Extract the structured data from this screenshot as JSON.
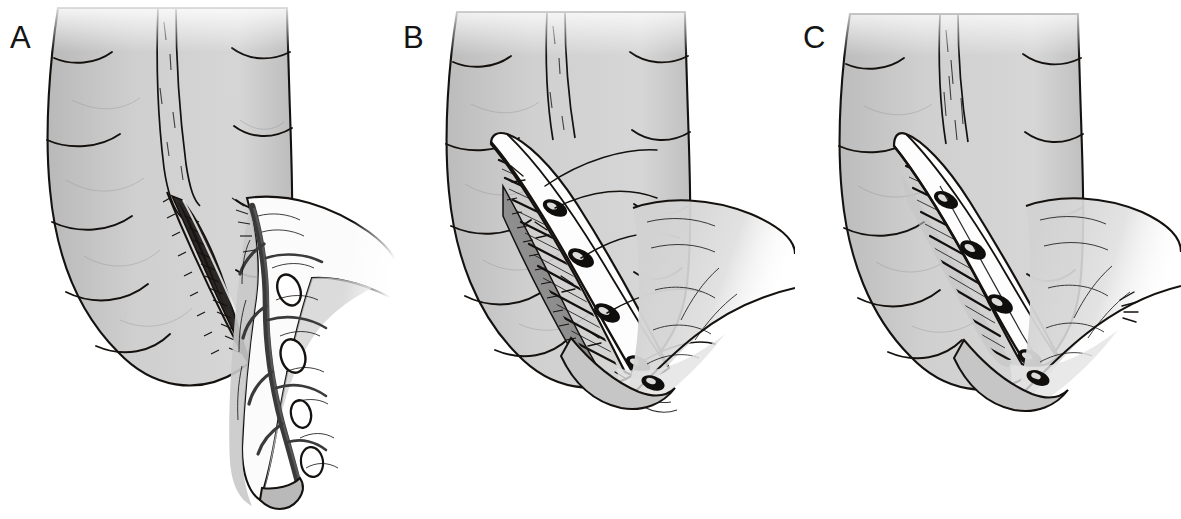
{
  "figure": {
    "background_color": "#ffffff",
    "ink_color": "#14110f",
    "bowel_fill_color": "#cccccc",
    "bowel_shadow_color": "#a9a9a9",
    "mesentery_fill_color": "#fbfbfb",
    "vessel_color": "#3a3a3a",
    "panel_count": 3
  },
  "panels": [
    {
      "id": "a",
      "label": "A",
      "stage_name": "incision",
      "description": "Sigmoid colon with haustra; a longitudinal dark incision opened along the antimesenteric taenia; mesentery fanning down-right with four vascular arcade fenestrations and a tapered distal tip.",
      "features": {
        "haustra_count": 6,
        "incision": "open-dark-slit",
        "suture_knots": 0,
        "mesentery_windows": 4,
        "mesentery_tail": "tapered-rounded-tip"
      }
    },
    {
      "id": "b",
      "label": "B",
      "stage_name": "mesenteric-window-opened",
      "description": "Same segment with the mesenteric defect spread open; rungs of divided tissue bridge the gap, crossing suture threads run across the opening, and four dark knots are set along the edge.",
      "features": {
        "haustra_count": 6,
        "incision": "open-with-retracted-edges",
        "suture_knots": 4,
        "suture_threads": 5,
        "tissue_rungs": 9,
        "mesentery_windows": 0,
        "mesentery_tail": "broad-fan-fading-right"
      }
    },
    {
      "id": "c",
      "label": "C",
      "stage_name": "closure",
      "description": "Final stage: the defect is narrowed and approximated; a neat line of four dark suture knots runs along the closed margin with short tissue rungs between them.",
      "features": {
        "haustra_count": 6,
        "incision": "closed-approximated",
        "suture_knots": 4,
        "tissue_rungs": 8,
        "mesentery_windows": 0,
        "mesentery_tail": "broad-fan-fading-right"
      }
    }
  ]
}
